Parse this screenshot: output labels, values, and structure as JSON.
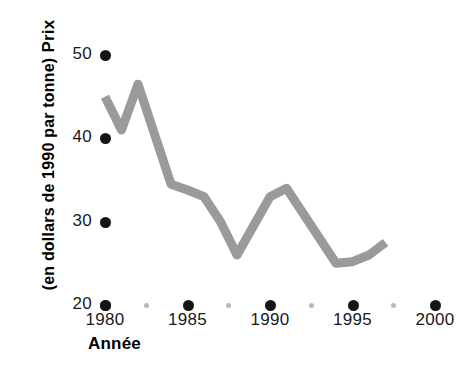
{
  "chart_data": {
    "type": "line",
    "title": "",
    "xlabel": "Année",
    "ylabel_line1": "Prix",
    "ylabel_line2": "(en dollars de 1990 par tonne)",
    "ylabel": "Prix (en dollars de 1990 par tonne)",
    "xlim": [
      1979,
      2001
    ],
    "ylim": [
      20,
      52
    ],
    "grid": false,
    "legend": false,
    "line_color": "#9a9a9a",
    "marker_color": "#151515",
    "minor_marker_color": "#b9b9b9",
    "x_ticks": [
      1980,
      1985,
      1990,
      1995,
      2000
    ],
    "x_tick_labels": [
      "1980",
      "1985",
      "1990",
      "1995",
      "2000"
    ],
    "x_minor_ticks": [
      1982.5,
      1987.5,
      1992.5,
      1997.5
    ],
    "y_ticks": [
      20,
      30,
      40,
      50
    ],
    "y_tick_labels": [
      "20",
      "30",
      "40",
      "50"
    ],
    "series": [
      {
        "name": "Prix",
        "x": [
          1980,
          1981,
          1982,
          1984,
          1985,
          1986,
          1987,
          1988,
          1990,
          1991,
          1994,
          1995,
          1996,
          1997
        ],
        "values": [
          45.0,
          41.0,
          46.5,
          34.5,
          33.8,
          33.0,
          30.0,
          26.0,
          33.0,
          34.0,
          25.0,
          25.2,
          26.0,
          27.5
        ]
      }
    ]
  }
}
